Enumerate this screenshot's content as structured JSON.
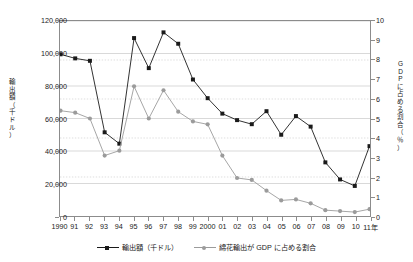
{
  "chart_data": {
    "type": "line",
    "title": "",
    "xlabel": "年",
    "x_axis_suffix": "年",
    "grid": true,
    "legend_position": "bottom-center",
    "x": [
      "1990",
      "91",
      "92",
      "93",
      "94",
      "95",
      "96",
      "97",
      "98",
      "99",
      "2000",
      "01",
      "02",
      "03",
      "04",
      "05",
      "06",
      "07",
      "08",
      "09",
      "10",
      "11"
    ],
    "xtick_labels": [
      "1990",
      "91",
      "92",
      "93",
      "94",
      "95",
      "96",
      "97",
      "98",
      "99",
      "2000",
      "01",
      "02",
      "03",
      "04",
      "05",
      "06",
      "07",
      "08",
      "09",
      "10",
      "11年"
    ],
    "axes": {
      "left": {
        "label": "輸出額（千ドル）",
        "label_chars": [
          "輸",
          "出",
          "額",
          "（",
          "千",
          "ド",
          "ル",
          "）"
        ],
        "min": 0,
        "max": 120000,
        "step": 20000,
        "ticks": [
          0,
          20000,
          40000,
          60000,
          80000,
          100000,
          120000
        ],
        "tick_labels": [
          "0",
          "20,000",
          "40,000",
          "60,000",
          "80,000",
          "100,000",
          "120,000"
        ]
      },
      "right": {
        "label": "GDPに占める割合（％）",
        "label_chars": [
          "G",
          "D",
          "P",
          "に",
          "占",
          "め",
          "る",
          "割",
          "合",
          "（",
          "％",
          "）"
        ],
        "min": 0,
        "max": 10,
        "step": 1,
        "ticks": [
          0,
          1,
          2,
          3,
          4,
          5,
          6,
          7,
          8,
          9,
          10
        ],
        "tick_labels": [
          "0",
          "1",
          "2",
          "3",
          "4",
          "5",
          "6",
          "7",
          "8",
          "9",
          "10"
        ]
      }
    },
    "series": [
      {
        "name": "輸出額（千ドル）",
        "axis": "left",
        "color": "#1a1a1a",
        "marker": "square",
        "unit": "千ドル",
        "values": [
          99500,
          97000,
          95500,
          51500,
          44500,
          109500,
          91000,
          113000,
          106000,
          84000,
          72500,
          63000,
          59000,
          56500,
          64500,
          50000,
          61500,
          55000,
          33000,
          22500,
          18500,
          43000
        ]
      },
      {
        "name": "綿花輸出が GDP に占める割合",
        "axis": "right",
        "color": "#9b9b9b",
        "marker": "circle",
        "unit": "%",
        "values": [
          5.4,
          5.3,
          5.0,
          3.1,
          3.35,
          6.65,
          5.0,
          6.45,
          5.35,
          4.85,
          4.7,
          3.1,
          1.95,
          1.85,
          1.3,
          0.8,
          0.85,
          0.65,
          0.3,
          0.25,
          0.2,
          0.35
        ]
      }
    ]
  },
  "legend": {
    "entries": [
      {
        "label": "輸出額（千ドル）"
      },
      {
        "label": "綿花輸出が GDP に占める割合"
      }
    ]
  },
  "colors": {
    "series_export": "#1a1a1a",
    "series_share": "#9b9b9b",
    "frame": "#8c8c8c",
    "grid": "#d9d9d9",
    "background": "#ffffff"
  }
}
